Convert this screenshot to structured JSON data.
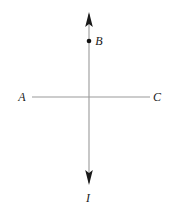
{
  "figure": {
    "canvas": {
      "width": 174,
      "height": 209,
      "background": "#ffffff"
    },
    "colors": {
      "line": "#9a9a9a",
      "arrowhead": "#1a1a1a",
      "point": "#111111",
      "label": "#1a1a1a"
    },
    "elements": {
      "vertical_line": {
        "name": "current-wire",
        "x": 89,
        "y_top": 12,
        "y_bottom": 185,
        "arrow_top": true,
        "arrow_bottom": true
      },
      "horizontal_line": {
        "name": "line-AC",
        "y": 97,
        "x_left": 32,
        "x_right": 150,
        "arrow_left": false,
        "arrow_right": false
      },
      "point_B": {
        "x": 89,
        "y": 41,
        "radius": 2.3
      }
    },
    "labels": {
      "a": {
        "text": "A",
        "x": 22,
        "y": 101
      },
      "b": {
        "text": "B",
        "x": 96,
        "y": 45
      },
      "c": {
        "text": "C",
        "x": 153,
        "y": 101
      },
      "i": {
        "text": "I",
        "x": 86,
        "y": 202
      }
    }
  }
}
